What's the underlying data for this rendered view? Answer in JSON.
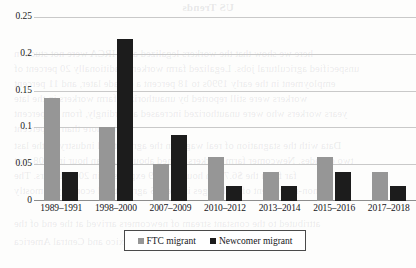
{
  "chart_data": {
    "type": "bar",
    "title": "",
    "xlabel": "",
    "ylabel": "",
    "ylim": [
      0,
      0.25
    ],
    "yticks": [
      "0",
      "0.05",
      "0.1",
      "0.15",
      "0.2",
      "0.25"
    ],
    "ytick_values": [
      0,
      0.05,
      0.1,
      0.15,
      0.2,
      0.25
    ],
    "grid": true,
    "legend_position": "bottom",
    "categories": [
      "1989–1991",
      "1998–2000",
      "2007–2009",
      "2010–2012",
      "2013–2014",
      "2015–2016",
      "2017–2018"
    ],
    "series": [
      {
        "name": "FTC migrant",
        "color": "#969696",
        "values": [
          0.14,
          0.1,
          0.05,
          0.06,
          0.04,
          0.06,
          0.04
        ]
      },
      {
        "name": "Newcomer migrant",
        "color": "#1c1c1c",
        "values": [
          0.04,
          0.22,
          0.09,
          0.02,
          0.02,
          0.04,
          0.02
        ]
      }
    ]
  },
  "legend": {
    "items": [
      {
        "label": "FTC migrant",
        "marker": "gray-square-marker"
      },
      {
        "label": "Newcomer migrant",
        "marker": "black-square-marker"
      }
    ]
  },
  "bleed_through": {
    "title": "US Trends",
    "lines": [
      "here we show that the workers legalized after IRCA were not stuck in",
      "unspecified agricultural jobs. Legalized farm workers traditionally 20 percent of",
      "employment in the early 1990s to 18 percent a decade later, and 11 percent",
      "workers were still reported by unauthorized farm workers in the late",
      "years workers who were unauthorized increased accordingly, from 13 percent",
      "to more than 50 percent",
      "Data with the stagnation of real wages in the agricultural industry of the last",
      "two decades. Newcomer farm workers earned about $7.25 an hour in 2008, not",
      "far from the $6.75 an hour in 1989 expressed in 2008 dollars. The",
      "non-movement of real wages in the US agricultural economy is mostly",
      "attributed to the constant stream of newcomers arrived at the end of the",
      "period in the United States from Mexico and Central America"
    ]
  }
}
